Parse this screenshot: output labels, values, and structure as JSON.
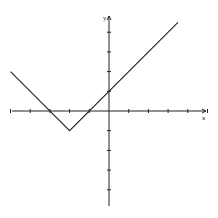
{
  "chart_data": {
    "type": "line",
    "title": "",
    "xlabel": "x",
    "ylabel": "y",
    "function": "y = |x + 2| - 1",
    "xlim": [
      -5,
      5
    ],
    "ylim": [
      -5,
      5
    ],
    "x_ticks": [
      -5,
      -4,
      -3,
      -2,
      -1,
      1,
      2,
      3,
      4,
      5
    ],
    "y_ticks": [
      -4,
      -3,
      -2,
      -1,
      1,
      2,
      3,
      4
    ],
    "grid": false,
    "series": [
      {
        "name": "f(x)",
        "x": [
          -5,
          -2,
          3.5
        ],
        "y": [
          2,
          -1,
          4.5
        ]
      }
    ],
    "key_points": {
      "vertex": [
        -2,
        -1
      ],
      "x_intercepts": [
        [
          -3,
          0
        ],
        [
          -1,
          0
        ]
      ],
      "y_intercept": [
        0,
        1
      ]
    }
  },
  "axes": {
    "x_label": "x",
    "y_label": "y"
  }
}
